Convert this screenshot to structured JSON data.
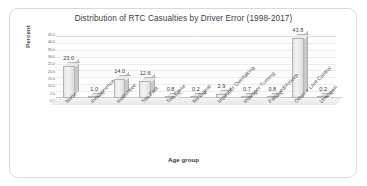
{
  "chart_data": {
    "type": "bar",
    "title": "Distribution of RTC Casualties by Driver Error (1998-2017)",
    "xlabel": "Age group",
    "ylabel": "Percent",
    "categories": [
      "None",
      "Inexperience",
      "Inattentive",
      "Too Fast",
      "Too Close",
      "No Signal",
      "Improper Overtaking",
      "Improper Turning",
      "Fatigued/Asleep",
      "Other + Lost Control",
      "Unknown"
    ],
    "values": [
      23.0,
      1.0,
      14.0,
      12.6,
      0.8,
      0.2,
      2.9,
      0.7,
      0.8,
      43.8,
      0.2
    ],
    "value_labels": [
      "23.0",
      "1.0",
      "14.0",
      "12.6",
      "0.8",
      "0.2",
      "2.9",
      "0.7",
      "0.8",
      "43.8",
      "0.2"
    ],
    "ylim": [
      0,
      45
    ],
    "ytick_labels": [
      "45.0",
      "40.0",
      "35.0",
      "30.0",
      "25.0",
      "20.0",
      "15.0",
      "10.0",
      "5.0",
      "0.0"
    ],
    "ytick_values": [
      45,
      40,
      35,
      30,
      25,
      20,
      15,
      10,
      5,
      0
    ],
    "grid": true,
    "legend": false,
    "style": "3d-bar",
    "bar_color": "#e6e6e6",
    "bar_edge_color": "#b4b4b4",
    "grid_color": "#ececec",
    "text_color": "#3c3c3c",
    "background": "#ffffff"
  }
}
